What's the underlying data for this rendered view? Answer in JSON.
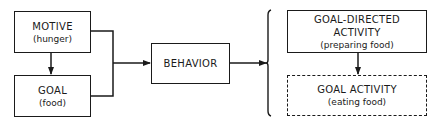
{
  "diagram": {
    "nodes": {
      "motive": {
        "title": "MOTIVE",
        "subtitle": "(hunger)"
      },
      "goal": {
        "title": "GOAL",
        "subtitle": "(food)"
      },
      "behavior": {
        "title": "BEHAVIOR"
      },
      "goal_directed": {
        "title_line1": "GOAL-DIRECTED",
        "title_line2": "ACTIVITY",
        "subtitle": "(preparing food)"
      },
      "goal_activity": {
        "title": "GOAL ACTIVITY",
        "subtitle": "(eating food)"
      }
    },
    "edges": [
      {
        "from": "motive",
        "to": "goal"
      },
      {
        "from": "motive+goal",
        "to": "behavior"
      },
      {
        "from": "behavior",
        "to": "goal_directed+goal_activity"
      },
      {
        "from": "goal_directed",
        "to": "goal_activity"
      }
    ],
    "colors": {
      "line": "#1a1a1a",
      "background": "#ffffff"
    }
  }
}
